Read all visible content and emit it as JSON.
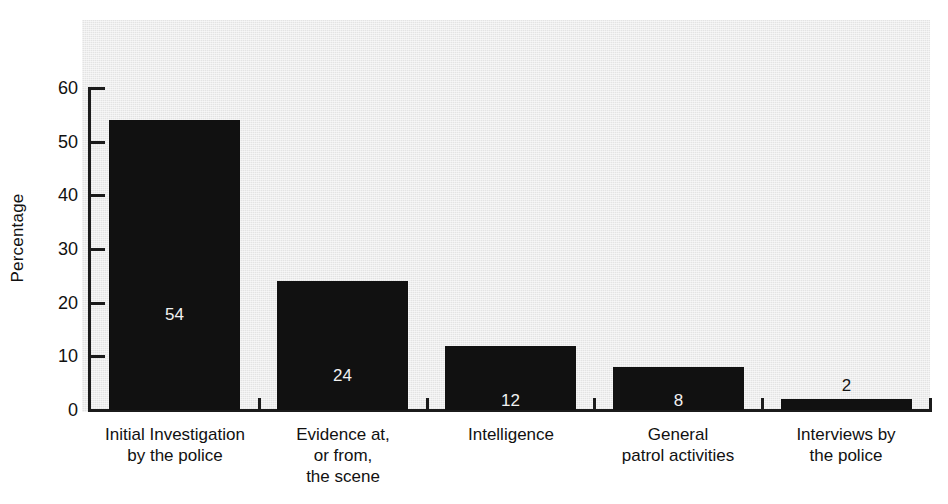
{
  "chart_data": {
    "type": "bar",
    "title": "",
    "subtitle": "",
    "xlabel": "",
    "ylabel": "Percentage",
    "ylim": [
      0,
      60
    ],
    "yticks": [
      0,
      10,
      20,
      30,
      40,
      50,
      60
    ],
    "ytick_labels": [
      "0",
      "10",
      "20",
      "30",
      "40",
      "50",
      "60"
    ],
    "grid": false,
    "legend": null,
    "bar_color": "#111111",
    "plot_background": "#e3e3e3",
    "categories": [
      "Initial Investigation by the police",
      "Evidence at, or from, the scene",
      "Intelligence",
      "General patrol activities",
      "Interviews by the police"
    ],
    "category_lines": [
      [
        "Initial Investigation",
        "by the police"
      ],
      [
        "Evidence at,",
        "or from,",
        "the scene"
      ],
      [
        "Intelligence"
      ],
      [
        "General",
        "patrol activities"
      ],
      [
        "Interviews by",
        "the police"
      ]
    ],
    "values": [
      54,
      24,
      12,
      8,
      2
    ],
    "data_labels": [
      "54",
      "24",
      "12",
      "8",
      "2"
    ],
    "data_label_position": [
      "inside",
      "inside",
      "inside",
      "inside",
      "outside"
    ]
  },
  "axes": {
    "y_title": "Percentage"
  }
}
